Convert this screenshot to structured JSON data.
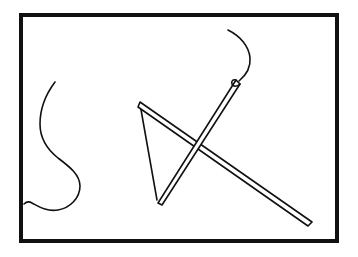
{
  "image": {
    "title": "Line drawing sketch",
    "description": "Black-and-white outline sketch of a needle, thread and a kite-like triangle inside a rectangular frame",
    "width": 358,
    "height": 257,
    "background_color": "#ffffff",
    "ink_color": "#111111"
  },
  "frame": {
    "name": "picture-frame",
    "x": 19,
    "y": 13,
    "width": 320,
    "height": 230,
    "stroke_width": 4,
    "color": "#111111"
  },
  "strokes": {
    "thread_curve": {
      "label": "S-shaped thread curve",
      "path": "M 55 82 C 46 94 40 108 40 124 C 40 140 48 150 58 158 C 70 167 80 175 80 186 C 80 198 70 208 58 210 C 46 212 38 206 32 203 C 29 201 26 202 24 204",
      "stroke_width": 1.6,
      "color": "#111111"
    },
    "needle_eye_curve": {
      "label": "Curved thread above needle eye",
      "path": "M 228 30 C 240 36 249 46 250 58 C 251 69 245 76 239 81",
      "stroke_width": 1.6,
      "color": "#111111"
    },
    "triangle_thin_edge": {
      "label": "Thin left edge of triangle",
      "path": "M 140 104 L 157 200",
      "stroke_width": 1.6,
      "color": "#111111"
    },
    "triangle_thick_bar": {
      "label": "Thick outlined bar from triangle apex to lower right",
      "points": "140,102 312,222 308,226 138,107",
      "stroke_width": 1.6,
      "fill": "#ffffff",
      "color": "#111111"
    },
    "needle_bar": {
      "label": "Thick outlined needle bar from lower left to upper right tip",
      "points": "158,203 236,80 240,84 162,205",
      "stroke_width": 1.6,
      "fill": "#ffffff",
      "color": "#111111"
    },
    "needle_tip_loop": {
      "label": "Needle eye loop at top of needle bar",
      "path": "M 236 80 C 233 79 231 81 232 84 C 233 87 237 87 240 84",
      "stroke_width": 1.6,
      "color": "#111111"
    }
  }
}
